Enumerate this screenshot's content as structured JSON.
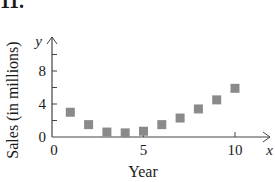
{
  "problem_number": "11.",
  "chart_data": {
    "type": "scatter",
    "title": "",
    "xlabel": "Year",
    "ylabel": "Sales (in millions)",
    "x_axis_var": "x",
    "y_axis_var": "y",
    "xlim": [
      0,
      10
    ],
    "ylim": [
      0,
      10
    ],
    "x_ticks": [
      5,
      10
    ],
    "x_tick_labels": [
      "0",
      "5",
      "10"
    ],
    "y_ticks": [
      2,
      4,
      6,
      8,
      10
    ],
    "y_tick_labels": [
      "0",
      "4",
      "8"
    ],
    "grid": false,
    "legend": null,
    "marker": "square",
    "marker_color": "#8a8a8a",
    "points": [
      {
        "x": 1,
        "y": 3.0
      },
      {
        "x": 2,
        "y": 1.5
      },
      {
        "x": 3,
        "y": 0.6
      },
      {
        "x": 4,
        "y": 0.5
      },
      {
        "x": 5,
        "y": 0.7
      },
      {
        "x": 6,
        "y": 1.5
      },
      {
        "x": 7,
        "y": 2.3
      },
      {
        "x": 8,
        "y": 3.4
      },
      {
        "x": 9,
        "y": 4.5
      },
      {
        "x": 10,
        "y": 5.9
      }
    ]
  }
}
